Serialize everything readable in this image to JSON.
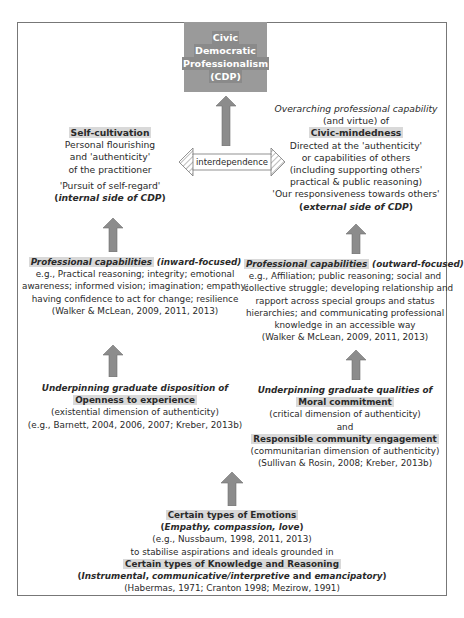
{
  "top": {
    "title_lines": [
      "Civic",
      "Democratic",
      "Professionalism",
      "(CDP)"
    ]
  },
  "interdependence": {
    "label": "interdependence"
  },
  "left_top": {
    "heading": "Self-cultivation",
    "lines": [
      "Personal flourishing",
      "and 'authenticity'",
      "of the practitioner"
    ],
    "quote": "'Pursuit of self-regard'",
    "side_open": "(",
    "side": "internal side of CDP",
    "side_close": ")"
  },
  "right_top": {
    "intro_italic": "Overarching professional capability",
    "intro_line2": "(and virtue) of",
    "heading": "Civic-mindedness",
    "lines": [
      "Directed at the 'authenticity'",
      "or capabilities of others",
      "(including supporting others'",
      "practical & public reasoning)"
    ],
    "quote": "'Our responsiveness towards others'",
    "side_open": "(",
    "side": "external side of CDP",
    "side_close": ")"
  },
  "left_mid": {
    "heading": "Professional capabilities",
    "qualifier": "(inward-focused)",
    "lines": [
      "e.g., Practical reasoning; integrity; emotional",
      "awareness; informed vision; imagination; empathy;",
      "having confidence to act for change; resilience",
      "(Walker & McLean, 2009, 2011, 2013)"
    ]
  },
  "right_mid": {
    "heading": "Professional capabilities",
    "qualifier": "(outward-focused)",
    "lines": [
      "e.g., Affiliation; public reasoning; social and",
      "collective struggle; developing relationship and",
      "rapport across special groups and status",
      "hierarchies; and communicating professional",
      "knowledge in an accessible way",
      "(Walker & McLean, 2009, 2011, 2013)"
    ]
  },
  "left_low": {
    "intro_italic": "Underpinning graduate disposition of",
    "heading": "Openness to experience",
    "lines": [
      "(existential dimension of authenticity)",
      "(e.g., Barnett, 2004, 2006, 2007; Kreber, 2013b)"
    ]
  },
  "right_low": {
    "intro_italic": "Underpinning graduate qualities of",
    "heading": "Moral commitment",
    "line1": "(critical dimension of authenticity)",
    "and": "and",
    "heading2": "Responsible community engagement",
    "lines": [
      "(communitarian dimension of authenticity)",
      "(Sullivan & Rosin, 2008; Kreber, 2013b)"
    ]
  },
  "bottom": {
    "heading": "Certain types of Emotions",
    "emotions_open": "(",
    "emotions": "Empathy, compassion, love",
    "emotions_close": ")",
    "cite1": "(e.g., Nussbaum, 1998, 2011, 2013)",
    "connector": "to stabilise aspirations and ideals grounded in",
    "heading2": "Certain types of Knowledge and Reasoning",
    "k_open": "(",
    "k1": "Instrumental",
    "k_sep1": ", ",
    "k2": "communicative/interpretive",
    "k_and": " and ",
    "k3": "emancipatory",
    "k_close": ")",
    "cite2": "(Habermas, 1971; Cranton 1998; Mezirow, 1991)"
  },
  "colors": {
    "box": "#9a9a9a",
    "arrow": "#8c8c8c",
    "highlight": "#d9d9d9",
    "border": "#777777"
  }
}
